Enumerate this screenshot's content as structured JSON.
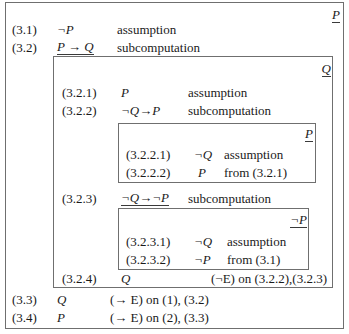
{
  "diagram": {
    "kind": "nested-subcomputation-proof",
    "outer": {
      "goal": "P",
      "lines": [
        {
          "label": "(3.1)",
          "formula": "¬P",
          "underlined": false,
          "justification": "assumption"
        },
        {
          "label": "(3.2)",
          "formula": "P → Q",
          "underlined": true,
          "justification": "subcomputation"
        },
        {
          "label": "(3.3)",
          "formula": "Q",
          "underlined": false,
          "justification": "(→ E) on (1), (3.2)"
        },
        {
          "label": "(3.4)",
          "formula": "P",
          "underlined": false,
          "justification": "(→ E) on (2), (3.3)"
        }
      ]
    },
    "box_q": {
      "goal": "Q",
      "lines": [
        {
          "label": "(3.2.1)",
          "formula": "P",
          "underlined": false,
          "justification": "assumption"
        },
        {
          "label": "(3.2.2)",
          "formula": "¬Q→P",
          "underlined": false,
          "justification": "subcomputation"
        },
        {
          "label": "(3.2.3)",
          "formula": "¬Q→¬P",
          "underlined": true,
          "justification": "subcomputation"
        },
        {
          "label": "(3.2.4)",
          "formula": "Q",
          "underlined": false,
          "justification": "(¬E) on (3.2.2),(3.2.3)"
        }
      ]
    },
    "box_p1": {
      "goal": "P",
      "lines": [
        {
          "label": "(3.2.2.1)",
          "formula": "¬Q",
          "underlined": false,
          "justification": "assumption"
        },
        {
          "label": "(3.2.2.2)",
          "formula": "P",
          "underlined": false,
          "justification": "from (3.2.1)"
        }
      ]
    },
    "box_p2": {
      "goal": "¬P",
      "lines": [
        {
          "label": "(3.2.3.1)",
          "formula": "¬Q",
          "underlined": false,
          "justification": "assumption"
        },
        {
          "label": "(3.2.3.2)",
          "formula": "¬P",
          "underlined": false,
          "justification": "from (3.1)"
        }
      ]
    },
    "colors": {
      "border": "#6f6f6f",
      "text": "#1a1a1a",
      "background": "#ffffff"
    }
  }
}
